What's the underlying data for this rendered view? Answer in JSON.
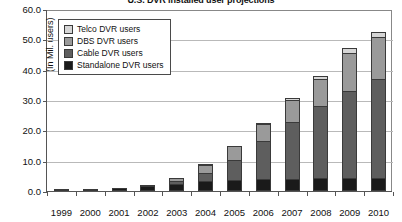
{
  "chart_data": {
    "type": "bar",
    "stacked": true,
    "title": "U.S. DVR installed user projections",
    "xlabel": "",
    "ylabel": "(In Mil. users)",
    "ylim": [
      0,
      60
    ],
    "ytick_step": 10,
    "ytick_labels": [
      "60.0",
      "50.0",
      "40.0",
      "30.0",
      "20.0",
      "10.0",
      "0.0"
    ],
    "ytick_values": [
      60,
      50,
      40,
      30,
      20,
      10,
      0
    ],
    "grid": true,
    "legend_position": "top-left",
    "categories": [
      "1999",
      "2000",
      "2001",
      "2002",
      "2003",
      "2004",
      "2005",
      "2006",
      "2007",
      "2008",
      "2009",
      "2010"
    ],
    "series": [
      {
        "name": "Standalone DVR users",
        "color": "#1a1a1a",
        "values": [
          0.2,
          0.5,
          0.9,
          1.6,
          2.4,
          3.2,
          3.6,
          3.9,
          4.1,
          4.2,
          4.3,
          4.3
        ]
      },
      {
        "name": "Cable DVR users",
        "color": "#5e5e5e",
        "values": [
          0.0,
          0.0,
          0.2,
          0.5,
          1.1,
          3.2,
          7.0,
          13.0,
          19.0,
          24.0,
          29.0,
          33.0
        ]
      },
      {
        "name": "DBS DVR users",
        "color": "#9a9a9a",
        "values": [
          0.0,
          0.0,
          0.0,
          0.4,
          1.3,
          3.0,
          5.0,
          6.0,
          7.5,
          9.5,
          13.0,
          14.0
        ]
      },
      {
        "name": "Telco DVR users",
        "color": "#d6d6d6",
        "values": [
          0.0,
          0.0,
          0.0,
          0.0,
          0.0,
          0.1,
          0.3,
          0.6,
          0.9,
          1.3,
          1.7,
          2.2
        ]
      }
    ],
    "totals": [
      0.2,
      0.5,
      1.1,
      2.5,
      4.8,
      9.5,
      15.9,
      23.5,
      31.5,
      39.0,
      48.0,
      53.5
    ]
  }
}
